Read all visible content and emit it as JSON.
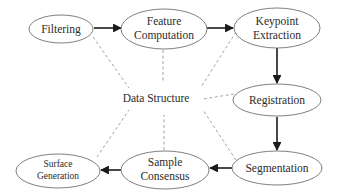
{
  "diagram": {
    "center_label": "Data Structure",
    "nodes": [
      {
        "id": "filtering",
        "lines": [
          "Filtering"
        ]
      },
      {
        "id": "feature",
        "lines": [
          "Feature",
          "Computation"
        ]
      },
      {
        "id": "keypoint",
        "lines": [
          "Keypoint",
          "Extraction"
        ]
      },
      {
        "id": "registration",
        "lines": [
          "Registration"
        ]
      },
      {
        "id": "segmentation",
        "lines": [
          "Segmentation"
        ]
      },
      {
        "id": "sample",
        "lines": [
          "Sample",
          "Consensus"
        ]
      },
      {
        "id": "surface",
        "lines": [
          "Surface",
          "Generation"
        ]
      }
    ],
    "flow": [
      "filtering",
      "feature",
      "keypoint",
      "registration",
      "segmentation",
      "sample",
      "surface"
    ],
    "colors": {
      "edge": "#1a1a1a",
      "dashed": "#9a9a9a",
      "ellipse_stroke": "#707070",
      "text": "#2b2b2b"
    }
  }
}
